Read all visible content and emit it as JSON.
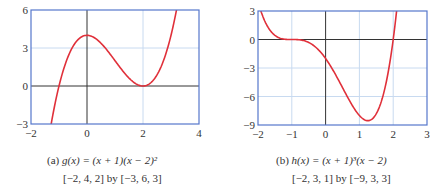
{
  "chart_data": [
    {
      "type": "line",
      "title": "g(x) = (x + 1)(x − 2)²",
      "caption_label": "(a)",
      "caption_fn": "g(x) = (x + 1)(x − 2)²",
      "window": "[−2, 4, 2] by [−3, 6, 3]",
      "xlim": [
        -2,
        4
      ],
      "ylim": [
        -3,
        6
      ],
      "xticks": [
        -2,
        0,
        2,
        4
      ],
      "xtick_labels": [
        "−2",
        "0",
        "2",
        "4"
      ],
      "yticks": [
        -3,
        0,
        3,
        6
      ],
      "ytick_labels": [
        "−3",
        "0",
        "3",
        "6"
      ],
      "grid": true,
      "series": [
        {
          "name": "g(x)",
          "color": "#e0303a",
          "x": [
            -1.35,
            -1.0,
            -0.5,
            0,
            0.5,
            1.0,
            1.5,
            2.0,
            2.5,
            3.0,
            3.2
          ],
          "y": [
            -3.09,
            0,
            3.13,
            4.0,
            3.38,
            2.0,
            0.63,
            0,
            0.88,
            4.0,
            6.05
          ]
        }
      ]
    },
    {
      "type": "line",
      "title": "h(x) = (x + 1)³(x − 2)",
      "caption_label": "(b)",
      "caption_fn": "h(x) = (x + 1)³(x − 2)",
      "window": "[−2, 3, 1] by [−9, 3, 3]",
      "xlim": [
        -2,
        3
      ],
      "ylim": [
        -9,
        3
      ],
      "xticks": [
        -2,
        -1,
        0,
        1,
        2,
        3
      ],
      "xtick_labels": [
        "−2",
        "−1",
        "0",
        "1",
        "2",
        "3"
      ],
      "yticks": [
        -9,
        -6,
        -3,
        0,
        3
      ],
      "ytick_labels": [
        "−9",
        "−6",
        "−3",
        "0",
        "3"
      ],
      "grid": true,
      "series": [
        {
          "name": "h(x)",
          "color": "#e0303a",
          "x": [
            -1.95,
            -1.5,
            -1.0,
            -0.5,
            0,
            0.5,
            1.0,
            1.25,
            1.5,
            2.0,
            2.1
          ],
          "y": [
            3.3,
            0.44,
            0,
            -0.31,
            -2.0,
            -5.06,
            -8.0,
            -8.54,
            -7.81,
            0,
            3.0
          ]
        }
      ]
    }
  ],
  "captions": {
    "a": {
      "label": "(a)",
      "fn": "g(x) = (x + 1)(x − 2)²",
      "window": "[−2, 4, 2] by [−3, 6, 3]"
    },
    "b": {
      "label": "(b)",
      "fn": "h(x) = (x + 1)³(x − 2)",
      "window": "[−2, 3, 1] by [−9, 3, 3]"
    }
  },
  "colors": {
    "curve": "#e0303a",
    "frame": "#5577cc",
    "grid": "#c8daf0",
    "axis": "#333333"
  }
}
